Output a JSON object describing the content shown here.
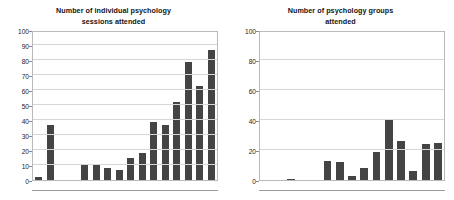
{
  "figure": {
    "background_color": "#ffffff",
    "bar_color": "#444444",
    "grid_color": "#d6d6d6",
    "axis_color": "#b9b9b9"
  },
  "panels": [
    {
      "title_line1": "Number of individual psychology",
      "title_line2": "sessions attended"
    },
    {
      "title_line1": "Number of psychology groups",
      "title_line2": "attended"
    }
  ],
  "chart_data": [
    {
      "type": "bar",
      "title": "Number of individual psychology sessions attended",
      "xlabel": "",
      "ylabel": "",
      "ylim": [
        0,
        100
      ],
      "ytick_step": 10,
      "yticks": [
        0,
        10,
        20,
        30,
        40,
        50,
        60,
        70,
        80,
        90,
        100
      ],
      "ytick_labels": [
        "0",
        "10",
        "20",
        "30",
        "40",
        "50",
        "60",
        "70",
        "80",
        "90",
        "100"
      ],
      "grid": true,
      "legend": false,
      "categories": [
        "1",
        "2",
        "3",
        "4",
        "5",
        "6",
        "7",
        "8",
        "9",
        "10",
        "11",
        "12",
        "13",
        "14",
        "15",
        "16"
      ],
      "values": [
        2,
        37,
        0,
        0,
        10,
        10,
        8,
        7,
        15,
        18,
        39,
        37,
        52,
        79,
        63,
        87
      ]
    },
    {
      "type": "bar",
      "title": "Number of psychology groups attended",
      "xlabel": "",
      "ylabel": "",
      "ylim": [
        0,
        100
      ],
      "ytick_step": 20,
      "yticks": [
        0,
        20,
        40,
        60,
        80,
        100
      ],
      "ytick_labels": [
        "0",
        "20",
        "40",
        "60",
        "80",
        "100"
      ],
      "grid": true,
      "legend": false,
      "categories": [
        "1",
        "2",
        "3",
        "4",
        "5",
        "6",
        "7",
        "8",
        "9",
        "10",
        "11",
        "12",
        "13",
        "14",
        "15"
      ],
      "values": [
        0,
        0,
        1,
        0,
        0,
        13,
        12,
        3,
        8,
        19,
        40,
        26,
        6,
        24,
        25
      ]
    }
  ]
}
